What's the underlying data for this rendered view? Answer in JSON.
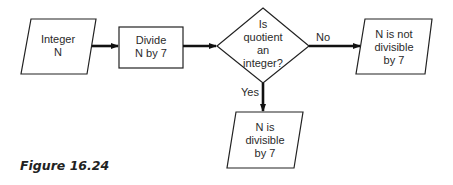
{
  "nodes": {
    "input": {
      "type": "parallelogram",
      "lines": [
        "Integer",
        "N"
      ]
    },
    "process": {
      "type": "rectangle",
      "lines": [
        "Divide",
        "N by 7"
      ]
    },
    "decision": {
      "type": "diamond",
      "lines": [
        "Is",
        "quotient",
        "an",
        "integer?"
      ]
    },
    "output_no": {
      "type": "parallelogram",
      "lines": [
        "N is not",
        "divisible",
        "by 7"
      ]
    },
    "output_yes": {
      "type": "parallelogram",
      "lines": [
        "N is",
        "divisible",
        "by 7"
      ]
    }
  },
  "edges": [
    {
      "from": "input",
      "to": "process",
      "label": ""
    },
    {
      "from": "process",
      "to": "decision",
      "label": ""
    },
    {
      "from": "decision",
      "to": "output_no",
      "label": "No"
    },
    {
      "from": "decision",
      "to": "output_yes",
      "label": "Yes"
    }
  ],
  "labels": {
    "no": "No",
    "yes": "Yes"
  },
  "caption": "Figure 16.24"
}
